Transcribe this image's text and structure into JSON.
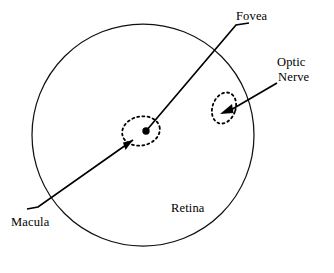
{
  "diagram": {
    "type": "anatomical-line-diagram",
    "background_color": "#ffffff",
    "stroke_color": "#000000"
  },
  "labels": {
    "fovea": "Fovea",
    "optic_nerve_line1": "Optic",
    "optic_nerve_line2": "Nerve",
    "macula": "Macula",
    "retina": "Retina"
  },
  "structures": {
    "retina": {
      "name": "Retina",
      "shape": "circle",
      "cx": 143,
      "cy": 135,
      "r": 111,
      "stroke": "#000000",
      "stroke_width": 1.2,
      "fill": "none",
      "dashed": false
    },
    "macula": {
      "name": "Macula",
      "shape": "ellipse",
      "cx": 141,
      "cy": 131,
      "rx": 19,
      "ry": 14.5,
      "rotation": -12,
      "stroke": "#000000",
      "stroke_width": 1.6,
      "fill": "none",
      "dashed": true,
      "dash_pattern": "2,3"
    },
    "fovea": {
      "name": "Fovea",
      "shape": "dot",
      "cx": 146,
      "cy": 131,
      "r": 3.6,
      "fill": "#000000"
    },
    "optic_nerve": {
      "name": "Optic Nerve",
      "shape": "ellipse",
      "cx": 224,
      "cy": 108,
      "rx": 11.5,
      "ry": 16,
      "rotation": 22,
      "stroke": "#000000",
      "stroke_width": 1.6,
      "fill": "none",
      "dashed": true,
      "dash_pattern": "2,3"
    }
  },
  "leaders": {
    "macula": {
      "label_for": "Macula",
      "points": "27,209 37,207 131,142",
      "arrow_at": "131,142",
      "stroke_width": 1.6
    },
    "fovea": {
      "label_for": "Fovea",
      "points": "146,131 236,25 248,23",
      "arrow_at": "none",
      "stroke_width": 1.6
    },
    "optic_nerve": {
      "label_for": "Optic Nerve",
      "points": "276,83 228,112",
      "arrow_at": "228,112",
      "stroke_width": 1.6
    }
  }
}
